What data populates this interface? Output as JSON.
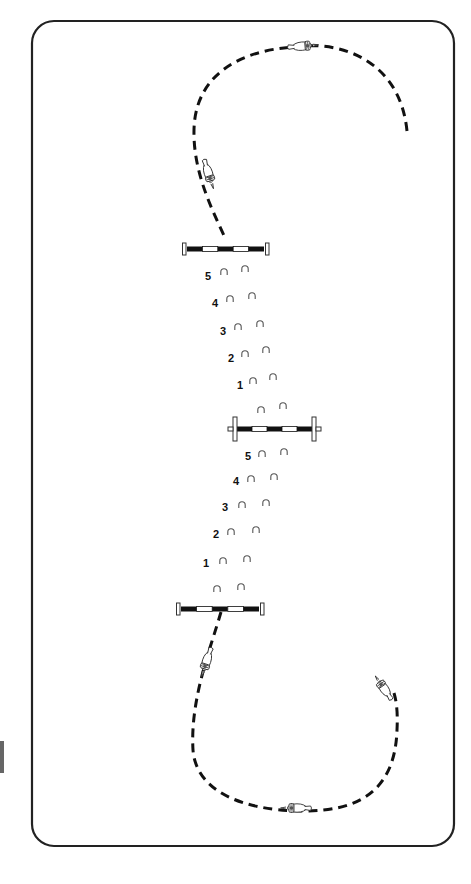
{
  "diagram": {
    "type": "show-jumping gymnastic line with bounce strides",
    "arena": {
      "x": 32,
      "y": 21,
      "width": 422,
      "height": 825,
      "radius": 22,
      "stroke": "#222222"
    },
    "colors": {
      "track": "#111111",
      "pole_black": "#111111",
      "pole_white": "#ffffff",
      "hoof": "#555555",
      "text": "#111111",
      "side_mark": "#666666"
    },
    "poles": [
      {
        "id": "pole-1",
        "x1": 184,
        "x2": 267,
        "y": 249,
        "stand_style": "upright"
      },
      {
        "id": "pole-2",
        "x1": 229,
        "x2": 320,
        "y": 429,
        "stand_style": "wing-cross"
      },
      {
        "id": "pole-3",
        "x1": 178,
        "x2": 262,
        "y": 609,
        "stand_style": "upright"
      }
    ],
    "stride_groups": [
      {
        "id": "between-pole-1-and-2",
        "strides": [
          {
            "label": "5",
            "num_x": 205,
            "y": 276,
            "hooves": [
              {
                "x": 224,
                "y": 272
              },
              {
                "x": 245,
                "y": 269
              }
            ]
          },
          {
            "label": "4",
            "num_x": 212,
            "y": 303,
            "hooves": [
              {
                "x": 230,
                "y": 299
              },
              {
                "x": 252,
                "y": 296
              }
            ]
          },
          {
            "label": "3",
            "num_x": 220,
            "y": 331,
            "hooves": [
              {
                "x": 238,
                "y": 327
              },
              {
                "x": 260,
                "y": 324
              }
            ]
          },
          {
            "label": "2",
            "num_x": 228,
            "y": 358,
            "hooves": [
              {
                "x": 245,
                "y": 354
              },
              {
                "x": 266,
                "y": 350
              }
            ]
          },
          {
            "label": "1",
            "num_x": 237,
            "y": 385,
            "hooves": [
              {
                "x": 253,
                "y": 381
              },
              {
                "x": 273,
                "y": 377
              }
            ]
          },
          {
            "label": "",
            "num_x": 0,
            "y": 0,
            "hooves": [
              {
                "x": 261,
                "y": 410
              },
              {
                "x": 283,
                "y": 406
              }
            ]
          }
        ]
      },
      {
        "id": "between-pole-2-and-3",
        "strides": [
          {
            "label": "5",
            "num_x": 245,
            "y": 456,
            "hooves": [
              {
                "x": 262,
                "y": 454
              },
              {
                "x": 284,
                "y": 452
              }
            ]
          },
          {
            "label": "4",
            "num_x": 233,
            "y": 481,
            "hooves": [
              {
                "x": 251,
                "y": 479
              },
              {
                "x": 274,
                "y": 477
              }
            ]
          },
          {
            "label": "3",
            "num_x": 222,
            "y": 507,
            "hooves": [
              {
                "x": 242,
                "y": 505
              },
              {
                "x": 266,
                "y": 503
              }
            ]
          },
          {
            "label": "2",
            "num_x": 213,
            "y": 534,
            "hooves": [
              {
                "x": 231,
                "y": 532
              },
              {
                "x": 256,
                "y": 530
              }
            ]
          },
          {
            "label": "1",
            "num_x": 203,
            "y": 563,
            "hooves": [
              {
                "x": 223,
                "y": 561
              },
              {
                "x": 247,
                "y": 559
              }
            ]
          },
          {
            "label": "",
            "num_x": 0,
            "y": 0,
            "hooves": [
              {
                "x": 217,
                "y": 589
              },
              {
                "x": 241,
                "y": 587
              }
            ]
          }
        ]
      }
    ],
    "tracks": [
      {
        "id": "approach-top",
        "path": "M 407 131 C 400 60, 340 40, 295 47 C 240 50, 195 75, 194 130 C 193 175, 215 215, 226 240"
      },
      {
        "id": "exit-bottom",
        "path": "M 221 612 C 210 650, 190 700, 193 750 C 196 790, 240 810, 300 811 C 360 812, 395 790, 397 730 C 398 710, 396 700, 394 693"
      }
    ],
    "riders": [
      {
        "id": "rider-top",
        "x": 304,
        "y": 46,
        "rotate": -5,
        "length": 30
      },
      {
        "id": "rider-upper-left",
        "x": 209,
        "y": 175,
        "rotate": 72,
        "length": 30
      },
      {
        "id": "rider-lower-left",
        "x": 206,
        "y": 663,
        "rotate": 108,
        "length": 30
      },
      {
        "id": "rider-bottom",
        "x": 295,
        "y": 808,
        "rotate": 180,
        "length": 30
      },
      {
        "id": "rider-lower-right",
        "x": 383,
        "y": 687,
        "rotate": -125,
        "length": 28
      }
    ],
    "side_mark": {
      "x": 0,
      "y": 741,
      "height": 32
    }
  }
}
